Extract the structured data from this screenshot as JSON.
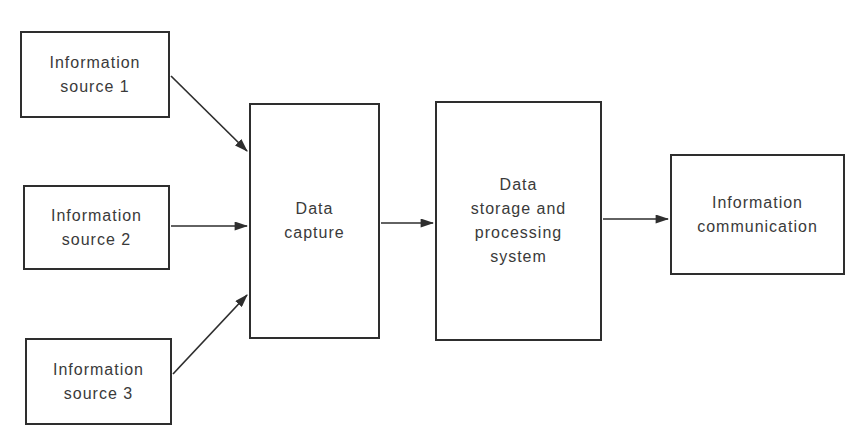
{
  "diagram": {
    "type": "block-flow-diagram",
    "nodes": [
      {
        "id": "source1",
        "label": "Information\nsource 1"
      },
      {
        "id": "source2",
        "label": "Information\nsource 2"
      },
      {
        "id": "source3",
        "label": "Information\nsource 3"
      },
      {
        "id": "capture",
        "label": "Data\ncapture"
      },
      {
        "id": "storage",
        "label": "Data\nstorage and\nprocessing\nsystem"
      },
      {
        "id": "communication",
        "label": "Information\ncommunication"
      }
    ],
    "edges": [
      {
        "from": "source1",
        "to": "capture"
      },
      {
        "from": "source2",
        "to": "capture"
      },
      {
        "from": "source3",
        "to": "capture"
      },
      {
        "from": "capture",
        "to": "storage"
      },
      {
        "from": "storage",
        "to": "communication"
      }
    ],
    "colors": {
      "background": "#ffffff",
      "line": "#2e2e2e",
      "text": "#3a3a3a"
    }
  }
}
